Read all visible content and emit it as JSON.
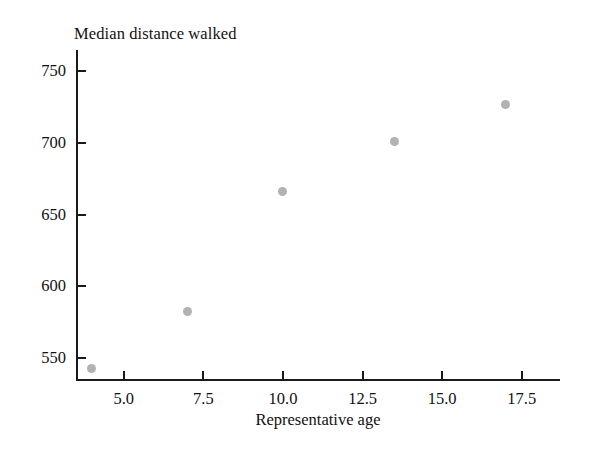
{
  "chart_data": {
    "type": "scatter",
    "title": "Median distance walked",
    "xlabel": "Representative age",
    "ylabel": "",
    "x": [
      4,
      7,
      10,
      13.5,
      17
    ],
    "values": [
      542,
      582,
      666,
      701,
      727
    ],
    "series": [
      {
        "name": "Median distance walked",
        "x": [
          4,
          7,
          10,
          13.5,
          17
        ],
        "values": [
          542,
          582,
          666,
          701,
          727
        ]
      }
    ],
    "points": [
      {
        "x": 4,
        "y": 542
      },
      {
        "x": 7,
        "y": 582
      },
      {
        "x": 10,
        "y": 666
      },
      {
        "x": 13.5,
        "y": 701
      },
      {
        "x": 17,
        "y": 727
      }
    ],
    "xlim": [
      3.5,
      18.7
    ],
    "ylim": [
      535,
      765
    ],
    "xticks": [
      5.0,
      7.5,
      10.0,
      12.5,
      15.0,
      17.5
    ],
    "yticks": [
      550,
      600,
      650,
      700,
      750
    ],
    "xticklabels": [
      "5.0",
      "7.5",
      "10.0",
      "12.5",
      "15.0",
      "17.5"
    ],
    "yticklabels": [
      "550",
      "600",
      "650",
      "700",
      "750"
    ],
    "grid": false,
    "legend": false,
    "legend_position": "none",
    "marker_color": "#b2b2b2",
    "axis_color": "#1a1a1a",
    "background_color": "#ffffff",
    "spines": [
      "left",
      "bottom"
    ]
  }
}
